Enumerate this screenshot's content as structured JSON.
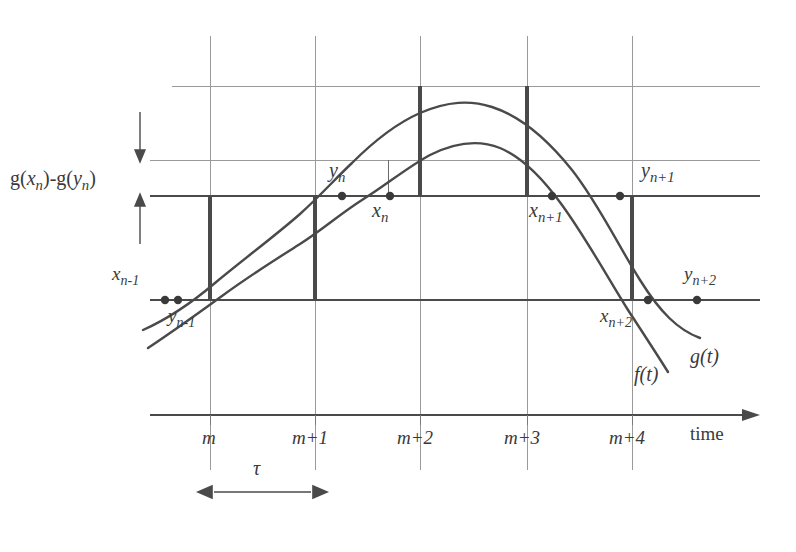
{
  "figure": {
    "kind": "level-crossing sampling diagram",
    "axis_label": "time",
    "colors": {
      "ink": "#3a3a3a",
      "grid_light": "#9a9a9a",
      "grid_dark": "#4a4a4a",
      "curve": "#4a4a4a",
      "background": "#ffffff"
    },
    "annotations": {
      "amplitude_gap": "g(xn)-g(yn)",
      "amplitude_gap_parts": {
        "g1": "g(",
        "x_base": "x",
        "x_sub": "n",
        "mid": ")-g(",
        "y_base": "y",
        "y_sub": "n",
        "close": ")"
      },
      "tau": "τ"
    },
    "curves": [
      {
        "id": "f",
        "label": "f(t)",
        "label_x": 634,
        "label_y": 376
      },
      {
        "id": "g",
        "label": "g(t)",
        "label_x": 690,
        "label_y": 358
      }
    ],
    "sample_points": [
      {
        "id": "x-n-minus-1",
        "base": "x",
        "sub": "n-1",
        "px": 165,
        "py": 300,
        "label_x": 112,
        "label_y": 276
      },
      {
        "id": "y-n-minus-1",
        "base": "y",
        "sub": "n-1",
        "px": 178,
        "py": 300,
        "label_x": 168,
        "label_y": 318
      },
      {
        "id": "y-n",
        "base": "y",
        "sub": "n",
        "px": 342,
        "py": 196,
        "label_x": 329,
        "label_y": 172
      },
      {
        "id": "x-n",
        "base": "x",
        "sub": "n",
        "px": 390,
        "py": 196,
        "label_x": 372,
        "label_y": 212
      },
      {
        "id": "x-n-plus-1",
        "base": "x",
        "sub": "n+1",
        "px": 552,
        "py": 196,
        "label_x": 529,
        "label_y": 212
      },
      {
        "id": "y-n-plus-1",
        "base": "y",
        "sub": "n+1",
        "px": 620,
        "py": 196,
        "label_x": 641,
        "label_y": 172
      },
      {
        "id": "x-n-plus-2",
        "base": "x",
        "sub": "n+2",
        "px": 648,
        "py": 300,
        "label_x": 600,
        "label_y": 318
      },
      {
        "id": "y-n-plus-2",
        "base": "y",
        "sub": "n+2",
        "px": 697,
        "py": 300,
        "label_x": 684,
        "label_y": 276
      }
    ],
    "x_ticks": [
      {
        "label": "m",
        "base": "m",
        "sup": "",
        "px": 210,
        "label_x": 204,
        "label_y": 438
      },
      {
        "label": "m+1",
        "base": "m",
        "sup": "+1",
        "px": 315,
        "label_x": 296,
        "label_y": 438
      },
      {
        "label": "m+2",
        "base": "m",
        "sup": "+2",
        "px": 420,
        "label_x": 401,
        "label_y": 438
      },
      {
        "label": "m+3",
        "base": "m",
        "sup": "+3",
        "px": 527,
        "label_x": 508,
        "label_y": 438
      },
      {
        "label": "m+4",
        "base": "m",
        "sup": "+4",
        "px": 632,
        "label_x": 613,
        "label_y": 438
      }
    ],
    "horizontal_levels": [
      86,
      160,
      196,
      300,
      415
    ],
    "vertical_gridlines": [
      210,
      315,
      420,
      527,
      632
    ],
    "tau_span": {
      "from_px": 210,
      "to_px": 315,
      "y": 492,
      "label_x": 253,
      "label_y": 468
    }
  }
}
